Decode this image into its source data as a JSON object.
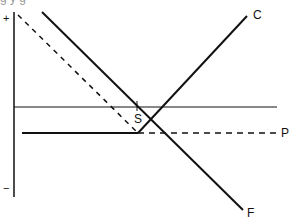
{
  "diagram": {
    "clipped_top_text": "g          y                                                  g",
    "axis": {
      "x": 14,
      "y_top": 12,
      "y_bottom": 197,
      "plus_label": "+",
      "plus_pos": [
        3,
        13
      ],
      "minus_label": "−",
      "minus_pos": [
        3,
        183
      ]
    },
    "lines": [
      {
        "id": "reference",
        "x1": 14,
        "y1": 107,
        "x2": 277,
        "y2": 107,
        "width": 1,
        "dash": ""
      },
      {
        "id": "P-solid",
        "x1": 22,
        "y1": 133,
        "x2": 138,
        "y2": 133,
        "width": 2,
        "dash": ""
      },
      {
        "id": "P-dashed",
        "x1": 138,
        "y1": 133,
        "x2": 276,
        "y2": 133,
        "width": 1.5,
        "dash": "6,5"
      },
      {
        "id": "F",
        "x1": 42,
        "y1": 12,
        "x2": 243,
        "y2": 210,
        "width": 2,
        "dash": ""
      },
      {
        "id": "C",
        "x1": 138,
        "y1": 133,
        "x2": 247,
        "y2": 16,
        "width": 2,
        "dash": ""
      },
      {
        "id": "shifted-F-dashed",
        "x1": 18,
        "y1": 15,
        "x2": 138,
        "y2": 133,
        "width": 1.5,
        "dash": "5,5"
      },
      {
        "id": "tick-S",
        "x1": 137,
        "y1": 101,
        "x2": 137,
        "y2": 111,
        "width": 1,
        "dash": ""
      }
    ],
    "labels": {
      "C": {
        "text": "C",
        "x": 253,
        "y": 9
      },
      "P": {
        "text": "P",
        "x": 281,
        "y": 127
      },
      "F": {
        "text": "F",
        "x": 247,
        "y": 207
      },
      "S": {
        "text": "S",
        "x": 134,
        "y": 113
      }
    },
    "colors": {
      "line": "#111111",
      "background": "#ffffff"
    }
  }
}
